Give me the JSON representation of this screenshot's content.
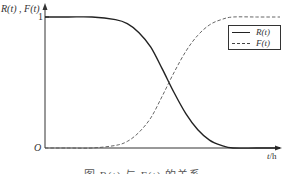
{
  "chart_data": {
    "type": "line",
    "title": "",
    "caption": "图 R(t) 与 F(t) 的关系",
    "xlabel": "t/h",
    "ylabel": "R(t) , F(t)",
    "y_ticks": [
      "1"
    ],
    "origin_label": "O",
    "ylim": [
      0,
      1
    ],
    "grid": false,
    "legend_position": "upper right",
    "x": [
      0,
      0.1,
      0.2,
      0.3,
      0.35,
      0.4,
      0.45,
      0.5,
      0.55,
      0.6,
      0.65,
      0.7,
      0.75,
      0.8,
      0.9,
      1.0
    ],
    "series": [
      {
        "name": "R(t)",
        "style": "solid",
        "values": [
          1,
          1,
          1,
          0.98,
          0.95,
          0.88,
          0.77,
          0.6,
          0.42,
          0.26,
          0.14,
          0.06,
          0.02,
          0,
          0,
          0
        ]
      },
      {
        "name": "F(t)",
        "style": "dashed",
        "values": [
          0,
          0,
          0,
          0.02,
          0.05,
          0.12,
          0.23,
          0.4,
          0.58,
          0.74,
          0.86,
          0.94,
          0.98,
          1,
          1,
          1
        ]
      }
    ]
  },
  "labels": {
    "ylabel": "R(t) , F(t)",
    "one": "1",
    "origin": "O",
    "xlabel_var": "t",
    "xlabel_unit": "/h",
    "legend_r": "R(t)",
    "legend_f": "F(t)",
    "caption": "图 R(t) 与 F(t) 的关系"
  },
  "colors": {
    "axis": "#333333",
    "r_curve": "#222222",
    "f_curve": "#555555"
  }
}
